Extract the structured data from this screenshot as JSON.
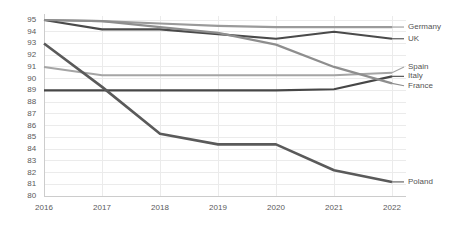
{
  "chart_data": {
    "type": "line",
    "title": "",
    "subtitle": "",
    "xlabel": "",
    "ylabel": "",
    "categories": [
      "2016",
      "2017",
      "2018",
      "2019",
      "2020",
      "2021",
      "2022"
    ],
    "x": [
      2016,
      2017,
      2018,
      2019,
      2020,
      2021,
      2022
    ],
    "ylim": [
      80,
      95
    ],
    "xlim": [
      2016,
      2022
    ],
    "yticks": [
      80,
      81,
      82,
      83,
      84,
      85,
      86,
      87,
      88,
      89,
      90,
      91,
      92,
      93,
      94,
      95
    ],
    "ytick_labels": [
      "80",
      "81",
      "82",
      "83",
      "84",
      "85",
      "86",
      "87",
      "88",
      "89",
      "90",
      "91",
      "92",
      "93",
      "94",
      "95"
    ],
    "xticks": [
      2016,
      2017,
      2018,
      2019,
      2020,
      2021,
      2022
    ],
    "xtick_labels": [
      "2016",
      "2017",
      "2018",
      "2019",
      "2020",
      "2021",
      "2022"
    ],
    "grid": true,
    "grid_axis": "both",
    "legend_position": "inline-right",
    "series": [
      {
        "name": "Germany",
        "color": "#9a9a9a",
        "width": 2.2,
        "values": [
          95.0,
          94.9,
          94.7,
          94.5,
          94.4,
          94.4,
          94.4
        ]
      },
      {
        "name": "UK",
        "color": "#4a4a4a",
        "width": 2.2,
        "values": [
          95.0,
          94.2,
          94.2,
          93.8,
          93.4,
          94.0,
          93.4
        ]
      },
      {
        "name": "Spain",
        "color": "#a5a5a5",
        "width": 2.0,
        "values": [
          91.0,
          90.3,
          90.3,
          90.3,
          90.3,
          90.3,
          90.5
        ]
      },
      {
        "name": "Italy",
        "color": "#474747",
        "width": 2.2,
        "values": [
          89.0,
          89.0,
          89.0,
          89.0,
          89.0,
          89.1,
          90.2
        ]
      },
      {
        "name": "France",
        "color": "#8e8e8e",
        "width": 2.2,
        "values": [
          95.0,
          94.9,
          94.4,
          93.9,
          92.9,
          91.0,
          89.6
        ]
      },
      {
        "name": "Poland",
        "color": "#5a5a5a",
        "width": 2.6,
        "values": [
          93.0,
          89.3,
          85.3,
          84.4,
          84.4,
          82.2,
          81.2
        ]
      }
    ],
    "label_positions": [
      {
        "name": "Germany",
        "y": 94.4
      },
      {
        "name": "UK",
        "y": 93.4
      },
      {
        "name": "Spain",
        "y": 91.0
      },
      {
        "name": "Italy",
        "y": 90.2
      },
      {
        "name": "France",
        "y": 89.4
      },
      {
        "name": "Poland",
        "y": 81.2
      }
    ],
    "style": {
      "background": "#ffffff",
      "grid_color": "#ebebeb",
      "axis_color": "#cccccc",
      "tick_text_color": "#5a5a5a",
      "label_text_color": "#545454"
    }
  }
}
